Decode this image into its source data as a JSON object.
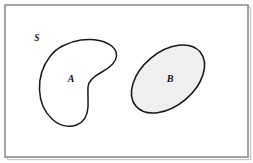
{
  "figure": {
    "kind": "set-diagram",
    "background_color": "#ffffff"
  },
  "frame": {
    "name": "universal-set-rectangle",
    "border_color": "#8e8e8e",
    "border_width": 1.6,
    "shadow_color": "#b9b9b9",
    "fill": "#ffffff",
    "x": 5,
    "y": 5,
    "width": 243,
    "height": 152
  },
  "labels": {
    "universe": "S",
    "set_a": "A",
    "set_b": "B"
  },
  "sets": [
    {
      "id": "set-a",
      "label": "A",
      "shape": "kidney",
      "fill": "#ffffff",
      "stroke": "#1a1a1a",
      "stroke_width": 1.5,
      "label_x": 71,
      "label_y": 82,
      "shaded": false
    },
    {
      "id": "set-b",
      "label": "B",
      "shape": "ellipse",
      "fill": "#efefef",
      "stroke": "#1a1a1a",
      "stroke_width": 1.6,
      "center_x": 168,
      "center_y": 79,
      "radius_x": 42,
      "radius_y": 27,
      "rotation_deg": -40,
      "label_x": 170,
      "label_y": 82,
      "shaded": true
    }
  ],
  "universe_label_position": {
    "x": 37,
    "y": 41
  },
  "colors": {
    "outline": "#1a1a1a",
    "frame": "#8e8e8e",
    "shade": "#efefef",
    "page": "#ffffff"
  }
}
